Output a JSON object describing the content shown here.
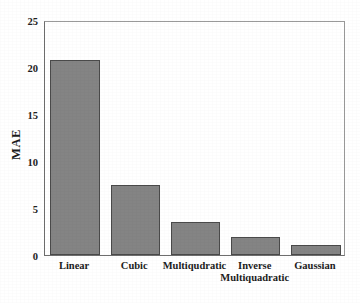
{
  "chart_data": {
    "type": "bar",
    "title": "",
    "xlabel": "",
    "ylabel": "MAE",
    "categories": [
      "Linear",
      "Cubic",
      "Multiqudratic",
      "Inverse\nMultiquadratic",
      "Gaussian"
    ],
    "values": [
      20.7,
      7.5,
      3.5,
      1.95,
      1.05
    ],
    "ylim": [
      0,
      25
    ],
    "yticks": [
      0,
      5,
      10,
      15,
      20,
      25
    ],
    "ytick_labels": [
      "0",
      "5",
      "10",
      "15",
      "20",
      "25"
    ],
    "grid": false,
    "legend": null,
    "bar_color": "#848484",
    "bar_edge_color": "#4a4a4a",
    "axes_color": "#6e6e6e",
    "background_color": "#ffffff"
  }
}
